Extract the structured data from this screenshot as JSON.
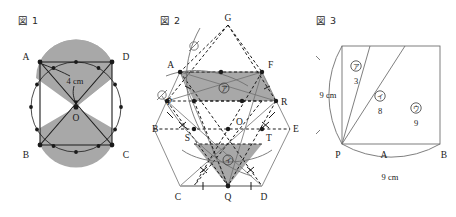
{
  "page": {
    "background": "#ffffff",
    "ink": "#1a1a1a",
    "shade": "#a8a8a8",
    "width": 456,
    "height": 217
  },
  "figure1": {
    "title": "図 1",
    "type": "circle-with-inscribed-quadrilateral",
    "center_label": "O",
    "radius_label": "4 cm",
    "dot_count": 12,
    "vertices": [
      {
        "id": "A",
        "label": "A",
        "position": "upper-left"
      },
      {
        "id": "D",
        "label": "D",
        "position": "upper-right"
      },
      {
        "id": "B",
        "label": "B",
        "position": "lower-left"
      },
      {
        "id": "C",
        "label": "C",
        "position": "lower-right"
      }
    ],
    "shaded": true
  },
  "figure2": {
    "title": "図 2",
    "type": "hexagon-construction-with-shaded-polygons",
    "points": [
      {
        "id": "G",
        "label": "G"
      },
      {
        "id": "A",
        "label": "A"
      },
      {
        "id": "F",
        "label": "F"
      },
      {
        "id": "P",
        "label": "P"
      },
      {
        "id": "R",
        "label": "R"
      },
      {
        "id": "B",
        "label": "B"
      },
      {
        "id": "O",
        "label": "O"
      },
      {
        "id": "E",
        "label": "E"
      },
      {
        "id": "S",
        "label": "S"
      },
      {
        "id": "T",
        "label": "T"
      },
      {
        "id": "C",
        "label": "C"
      },
      {
        "id": "Q",
        "label": "Q"
      },
      {
        "id": "D",
        "label": "D"
      }
    ],
    "region_labels": [
      {
        "id": "region-a",
        "mark": "ア",
        "region": "upper-shaded-parallelogram"
      },
      {
        "id": "region-i",
        "mark": "イ",
        "region": "lower-shaded-triangle"
      }
    ],
    "arc_markers": [
      {
        "id": "arc-marker-1",
        "mark": "⊘"
      },
      {
        "id": "arc-marker-2",
        "mark": "⊘"
      }
    ],
    "tick_marks": {
      "single": 6,
      "double": 4
    }
  },
  "figure3": {
    "title": "図 3",
    "type": "square-with-slanted-divisions-and-arcs",
    "points": [
      {
        "id": "P",
        "label": "P"
      },
      {
        "id": "A",
        "label": "A"
      },
      {
        "id": "B",
        "label": "B"
      }
    ],
    "dim_left": "9 cm",
    "dim_bottom": "9 cm",
    "regions": [
      {
        "mark": "ア",
        "value": "3"
      },
      {
        "mark": "イ",
        "value": "8"
      },
      {
        "mark": "ウ",
        "value": "9"
      }
    ]
  }
}
